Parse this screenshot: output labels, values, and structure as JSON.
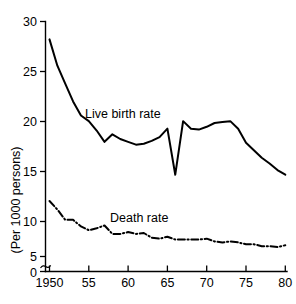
{
  "chart_data": {
    "type": "line",
    "title": "",
    "subtitle": "",
    "xlabel": "",
    "ylabel": "(Per 1000 persons)",
    "xlim": [
      1950,
      1980
    ],
    "ylim": [
      0,
      30
    ],
    "y_axis_break": {
      "between": [
        0,
        5
      ],
      "symbol": "squiggle"
    },
    "grid": false,
    "legend_position": "inline-annotation",
    "x_tick_labels": [
      "1950",
      "55",
      "60",
      "65",
      "70",
      "75",
      "80"
    ],
    "x_tick_values": [
      1950,
      1955,
      1960,
      1965,
      1970,
      1975,
      1980
    ],
    "y_tick_labels": [
      "0",
      "5",
      "10",
      "15",
      "20",
      "25",
      "30"
    ],
    "y_tick_values": [
      0,
      5,
      10,
      15,
      20,
      25,
      30
    ],
    "x": [
      1950,
      1951,
      1952,
      1953,
      1954,
      1955,
      1956,
      1957,
      1958,
      1959,
      1960,
      1961,
      1962,
      1963,
      1964,
      1965,
      1966,
      1967,
      1968,
      1969,
      1970,
      1971,
      1972,
      1973,
      1974,
      1975,
      1976,
      1977,
      1978,
      1979,
      1980
    ],
    "series": [
      {
        "name": "Live birth rate",
        "label": "Live birth rate",
        "linestyle": "solid",
        "color": "#000000",
        "values": [
          28.1,
          25.3,
          23.4,
          21.5,
          20.0,
          19.4,
          18.4,
          17.2,
          18.0,
          17.5,
          17.2,
          16.9,
          17.0,
          17.3,
          17.7,
          18.6,
          13.7,
          19.4,
          18.6,
          18.5,
          18.8,
          19.2,
          19.3,
          19.4,
          18.6,
          17.1,
          16.3,
          15.5,
          14.9,
          14.2,
          13.7
        ]
      },
      {
        "name": "Death rate",
        "label": "Death rate",
        "linestyle": "dash-dot",
        "color": "#000000",
        "values": [
          10.9,
          10.0,
          8.9,
          8.9,
          8.2,
          7.8,
          8.0,
          8.3,
          7.4,
          7.4,
          7.6,
          7.4,
          7.5,
          7.0,
          6.9,
          7.1,
          6.8,
          6.8,
          6.8,
          6.8,
          6.9,
          6.6,
          6.5,
          6.6,
          6.5,
          6.3,
          6.3,
          6.1,
          6.1,
          6.0,
          6.2
        ]
      }
    ],
    "annotations": [
      {
        "text": "Live birth rate",
        "x_px": 85,
        "y_px": 118
      },
      {
        "text": "Death rate",
        "x_px": 110,
        "y_px": 222
      }
    ]
  }
}
